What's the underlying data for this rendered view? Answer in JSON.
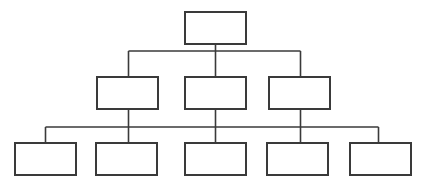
{
  "diagram": {
    "type": "hierarchy-tree",
    "canvas": {
      "width": 425,
      "height": 188,
      "background": "#ffffff"
    },
    "style": {
      "node_fill": "#ffffff",
      "node_stroke": "#3a3a3a",
      "node_stroke_width": 2,
      "connector_stroke": "#3a3a3a",
      "connector_stroke_width": 1.6
    },
    "levels": [
      {
        "level": 1,
        "name": "root-level",
        "nodes": [
          {
            "id": "n1",
            "label": "",
            "x": 184,
            "y": 11,
            "w": 63,
            "h": 34
          }
        ]
      },
      {
        "level": 2,
        "name": "middle-level",
        "nodes": [
          {
            "id": "n2",
            "label": "",
            "x": 96,
            "y": 76,
            "w": 63,
            "h": 34
          },
          {
            "id": "n3",
            "label": "",
            "x": 184,
            "y": 76,
            "w": 63,
            "h": 34
          },
          {
            "id": "n4",
            "label": "",
            "x": 268,
            "y": 76,
            "w": 63,
            "h": 34
          }
        ]
      },
      {
        "level": 3,
        "name": "leaf-level",
        "nodes": [
          {
            "id": "n5",
            "label": "",
            "x": 14,
            "y": 142,
            "w": 63,
            "h": 34
          },
          {
            "id": "n6",
            "label": "",
            "x": 95,
            "y": 142,
            "w": 63,
            "h": 34
          },
          {
            "id": "n7",
            "label": "",
            "x": 184,
            "y": 142,
            "w": 63,
            "h": 34
          },
          {
            "id": "n8",
            "label": "",
            "x": 266,
            "y": 142,
            "w": 63,
            "h": 34
          },
          {
            "id": "n9",
            "label": "",
            "x": 349,
            "y": 142,
            "w": 63,
            "h": 34
          }
        ]
      }
    ],
    "connectors": {
      "root_stem": {
        "x": 215.5,
        "y1": 45,
        "y2": 51
      },
      "bus_level2": {
        "y": 51,
        "x1": 128.5,
        "x2": 300.5
      },
      "drops_level2": [
        {
          "x": 128.5,
          "y1": 51,
          "y2": 76
        },
        {
          "x": 215.5,
          "y1": 51,
          "y2": 76
        },
        {
          "x": 300.5,
          "y1": 51,
          "y2": 76
        }
      ],
      "stems_level2_down": [
        {
          "x": 128.5,
          "y1": 110,
          "y2": 127
        },
        {
          "x": 215.5,
          "y1": 110,
          "y2": 127
        },
        {
          "x": 300.5,
          "y1": 110,
          "y2": 127
        }
      ],
      "bus_level3": {
        "y": 127,
        "x1": 45.5,
        "x2": 378.5
      },
      "drops_level3": [
        {
          "x": 45.5,
          "y1": 127,
          "y2": 142
        },
        {
          "x": 128.5,
          "y1": 127,
          "y2": 142
        },
        {
          "x": 215.5,
          "y1": 127,
          "y2": 142
        },
        {
          "x": 300.5,
          "y1": 127,
          "y2": 142
        },
        {
          "x": 378.5,
          "y1": 127,
          "y2": 142
        }
      ]
    }
  }
}
